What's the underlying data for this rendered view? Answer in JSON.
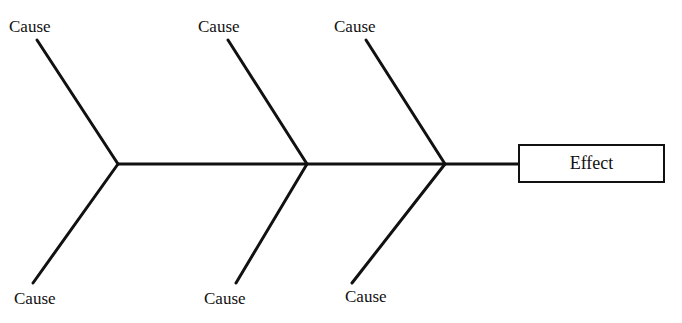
{
  "diagram": {
    "type": "fishbone (cause-and-effect)",
    "effect": {
      "label": "Effect"
    },
    "causes_top": [
      {
        "label": "Cause"
      },
      {
        "label": "Cause"
      },
      {
        "label": "Cause"
      }
    ],
    "causes_bottom": [
      {
        "label": "Cause"
      },
      {
        "label": "Cause"
      },
      {
        "label": "Cause"
      }
    ],
    "colors": {
      "line": "#111111",
      "background": "#ffffff"
    }
  }
}
